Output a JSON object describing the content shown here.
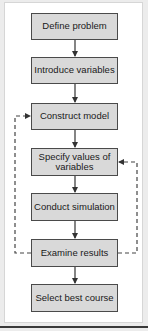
{
  "diagram": {
    "type": "flowchart",
    "steps": [
      {
        "id": "define",
        "label": "Define problem"
      },
      {
        "id": "introduce",
        "label": "Introduce variables"
      },
      {
        "id": "construct",
        "label": "Construct model"
      },
      {
        "id": "specify",
        "label": "Specify values of variables"
      },
      {
        "id": "conduct",
        "label": "Conduct simulation"
      },
      {
        "id": "examine",
        "label": "Examine results"
      },
      {
        "id": "select",
        "label": "Select best course"
      }
    ],
    "feedback_loops": [
      {
        "from": "Examine results",
        "to": "Construct model",
        "side": "left",
        "style": "dashed"
      },
      {
        "from": "Examine results",
        "to": "Specify values of variables",
        "side": "right",
        "style": "dashed"
      }
    ],
    "colors": {
      "box_fill": "#d9d9d9",
      "box_border": "#4a4a4a",
      "arrow": "#333333",
      "background": "#ffffff"
    }
  }
}
